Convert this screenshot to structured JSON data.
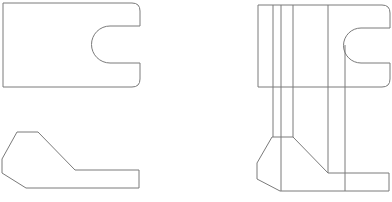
{
  "drawing": {
    "type": "orthographic technical drawing",
    "stroke_color": "#7a7a7a",
    "background": "#ffffff",
    "views": [
      {
        "name": "top-view-left",
        "description": "plate with U-slot on right edge"
      },
      {
        "name": "front-view-left",
        "description": "angled bracket profile"
      },
      {
        "name": "top-view-right",
        "description": "plate with U-slot and projection lines"
      },
      {
        "name": "front-view-right",
        "description": "angled bracket profile with projection lines"
      }
    ]
  }
}
